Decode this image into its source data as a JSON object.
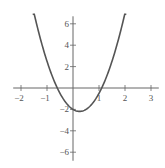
{
  "chart_data": {
    "type": "line",
    "title": "",
    "xlabel": "",
    "ylabel": "",
    "function": "y = 3x^2 - 1.5x - 2",
    "xlim": [
      -2.3,
      3.3
    ],
    "ylim": [
      -6.8,
      6.7
    ],
    "grid": false,
    "legend": null,
    "x_ticks": [
      -2,
      -1,
      1,
      2,
      3
    ],
    "y_ticks": [
      6,
      4,
      2,
      -2,
      -4,
      -6
    ],
    "x_tick_labels": [
      "−2",
      "−1",
      "1",
      "2",
      "3"
    ],
    "y_tick_labels": [
      "6",
      "4",
      "2",
      "−2",
      "−4",
      "−6"
    ],
    "series": [
      {
        "name": "parabola",
        "x": [
          -1.55,
          -1.25,
          -1.0,
          -0.75,
          -0.6,
          -0.5,
          -0.25,
          0,
          0.25,
          0.5,
          0.75,
          1.0,
          1.1,
          1.25,
          1.5,
          1.75,
          2.05
        ],
        "values": [
          7.53,
          4.56,
          2.5,
          0.81,
          0.0,
          -0.5,
          -1.44,
          -2.0,
          -2.19,
          -2.0,
          -1.44,
          -0.5,
          0.0,
          0.81,
          2.5,
          4.56,
          7.53
        ]
      }
    ],
    "annotations": []
  },
  "colors": {
    "curve": "#555555",
    "axis": "#666666",
    "background": "#ffffff"
  }
}
